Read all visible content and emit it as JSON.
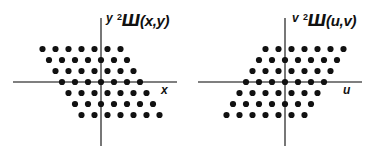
{
  "figure": {
    "background_color": "#ffffff",
    "ink_color": "#111111",
    "axis_color": "#555555",
    "width": 380,
    "height": 154
  },
  "panels": [
    {
      "id": "left",
      "name": "spatial-domain",
      "function_label": {
        "superscript": "2",
        "symbol": "Ш",
        "args": "(x,y)",
        "full": "²Ш(x,y)"
      },
      "vertical_axis_label": "y",
      "horizontal_axis_label": "x",
      "origin": {
        "x": 101,
        "y": 82
      },
      "axes": {
        "x_from": 13,
        "x_to": 177,
        "y_from": 18,
        "y_to": 146
      },
      "lattice": {
        "type": "sheared-rhombic",
        "rows": 7,
        "cols": 7,
        "col_spacing": 13.0,
        "row_spacing": 11.0,
        "shear_per_row": 6.5,
        "shear_direction": "right-going-down",
        "dot_radius": 3.1
      }
    },
    {
      "id": "right",
      "name": "frequency-domain",
      "function_label": {
        "superscript": "2",
        "symbol": "Ш",
        "args": "(u,v)",
        "full": "²Ш(u,v)"
      },
      "vertical_axis_label": "v",
      "horizontal_axis_label": "u",
      "origin": {
        "x": 95,
        "y": 82
      },
      "axes": {
        "x_from": 8,
        "x_to": 172,
        "y_from": 18,
        "y_to": 146
      },
      "lattice": {
        "type": "sheared-rhombic",
        "rows": 7,
        "cols": 7,
        "col_spacing": 13.0,
        "row_spacing": 11.0,
        "shear_per_row": -6.5,
        "shear_direction": "left-going-down",
        "dot_radius": 3.1
      }
    }
  ],
  "chart_data": {
    "type": "scatter",
    "subplots": [
      {
        "name": "²Ш(x,y)",
        "xlabel": "x",
        "ylabel": "y",
        "grid": false,
        "legend": null,
        "lattice_basis": {
          "e1": [
            1,
            0
          ],
          "e2": [
            0.5,
            -1
          ]
        },
        "description": "49 impulse samples on a sheared (rhombic) lattice, 7 rows by 7 columns, centered on the origin. Each row is offset 0.5 lattice units to the right relative to the row above.",
        "points_lattice_coords": [
          [
            -3,
            3
          ],
          [
            -2,
            3
          ],
          [
            -1,
            3
          ],
          [
            0,
            3
          ],
          [
            1,
            3
          ],
          [
            2,
            3
          ],
          [
            3,
            3
          ],
          [
            -3,
            2
          ],
          [
            -2,
            2
          ],
          [
            -1,
            2
          ],
          [
            0,
            2
          ],
          [
            1,
            2
          ],
          [
            2,
            2
          ],
          [
            3,
            2
          ],
          [
            -3,
            1
          ],
          [
            -2,
            1
          ],
          [
            -1,
            1
          ],
          [
            0,
            1
          ],
          [
            1,
            1
          ],
          [
            2,
            1
          ],
          [
            3,
            1
          ],
          [
            -3,
            0
          ],
          [
            -2,
            0
          ],
          [
            -1,
            0
          ],
          [
            0,
            0
          ],
          [
            1,
            0
          ],
          [
            2,
            0
          ],
          [
            3,
            0
          ],
          [
            -3,
            -1
          ],
          [
            -2,
            -1
          ],
          [
            -1,
            -1
          ],
          [
            0,
            -1
          ],
          [
            1,
            -1
          ],
          [
            2,
            -1
          ],
          [
            3,
            -1
          ],
          [
            -3,
            -2
          ],
          [
            -2,
            -2
          ],
          [
            -1,
            -2
          ],
          [
            0,
            -2
          ],
          [
            1,
            -2
          ],
          [
            2,
            -2
          ],
          [
            3,
            -2
          ],
          [
            -3,
            -3
          ],
          [
            -2,
            -3
          ],
          [
            -1,
            -3
          ],
          [
            0,
            -3
          ],
          [
            1,
            -3
          ],
          [
            2,
            -3
          ],
          [
            3,
            -3
          ]
        ],
        "n_points": 49
      },
      {
        "name": "²Ш(u,v)",
        "xlabel": "u",
        "ylabel": "v",
        "grid": false,
        "legend": null,
        "lattice_basis": {
          "e1": [
            1,
            0
          ],
          "e2": [
            -0.5,
            -1
          ]
        },
        "description": "49 impulse samples on the reciprocal sheared (rhombic) lattice, mirrored horizontally relative to the spatial-domain lattice.",
        "points_lattice_coords": [
          [
            -3,
            3
          ],
          [
            -2,
            3
          ],
          [
            -1,
            3
          ],
          [
            0,
            3
          ],
          [
            1,
            3
          ],
          [
            2,
            3
          ],
          [
            3,
            3
          ],
          [
            -3,
            2
          ],
          [
            -2,
            2
          ],
          [
            -1,
            2
          ],
          [
            0,
            2
          ],
          [
            1,
            2
          ],
          [
            2,
            2
          ],
          [
            3,
            2
          ],
          [
            -3,
            1
          ],
          [
            -2,
            1
          ],
          [
            -1,
            1
          ],
          [
            0,
            1
          ],
          [
            1,
            1
          ],
          [
            2,
            1
          ],
          [
            3,
            1
          ],
          [
            -3,
            0
          ],
          [
            -2,
            0
          ],
          [
            -1,
            0
          ],
          [
            0,
            0
          ],
          [
            1,
            0
          ],
          [
            2,
            0
          ],
          [
            3,
            0
          ],
          [
            -3,
            -1
          ],
          [
            -2,
            -1
          ],
          [
            -1,
            -1
          ],
          [
            0,
            -1
          ],
          [
            1,
            -1
          ],
          [
            2,
            -1
          ],
          [
            3,
            -1
          ],
          [
            -3,
            -2
          ],
          [
            -2,
            -2
          ],
          [
            -1,
            -2
          ],
          [
            0,
            -2
          ],
          [
            1,
            -2
          ],
          [
            2,
            -2
          ],
          [
            3,
            -2
          ],
          [
            -3,
            -3
          ],
          [
            -2,
            -3
          ],
          [
            -1,
            -3
          ],
          [
            0,
            -3
          ],
          [
            1,
            -3
          ],
          [
            2,
            -3
          ],
          [
            3,
            -3
          ]
        ],
        "n_points": 49
      }
    ]
  }
}
